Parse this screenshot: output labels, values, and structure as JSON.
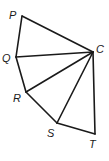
{
  "diagram": {
    "vertices": {
      "P": {
        "x": 22,
        "y": 16,
        "label": "P",
        "lx": 9,
        "ly": 19
      },
      "Q": {
        "x": 16,
        "y": 57,
        "label": "Q",
        "lx": 2,
        "ly": 62
      },
      "R": {
        "x": 26,
        "y": 92,
        "label": "R",
        "lx": 13,
        "ly": 102
      },
      "S": {
        "x": 57,
        "y": 123,
        "label": "S",
        "lx": 47,
        "ly": 137
      },
      "T": {
        "x": 95,
        "y": 134,
        "label": "T",
        "lx": 89,
        "ly": 148
      },
      "C": {
        "x": 93,
        "y": 52,
        "label": "C",
        "lx": 96,
        "ly": 53
      }
    },
    "edges": [
      [
        "P",
        "C"
      ],
      [
        "Q",
        "C"
      ],
      [
        "R",
        "C"
      ],
      [
        "S",
        "C"
      ],
      [
        "T",
        "C"
      ],
      [
        "P",
        "Q"
      ],
      [
        "Q",
        "R"
      ],
      [
        "R",
        "S"
      ],
      [
        "S",
        "T"
      ]
    ]
  }
}
